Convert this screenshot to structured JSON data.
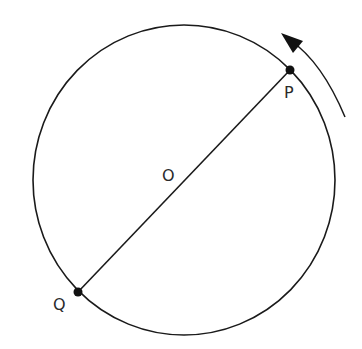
{
  "diagram": {
    "labels": {
      "center": "O",
      "point_p": "P",
      "point_q": "Q"
    },
    "rotation_direction": "counterclockwise",
    "colors": {
      "stroke": "#1a1a1a",
      "point": "#111111",
      "text": "#2a2a2a",
      "background": "#ffffff"
    }
  }
}
